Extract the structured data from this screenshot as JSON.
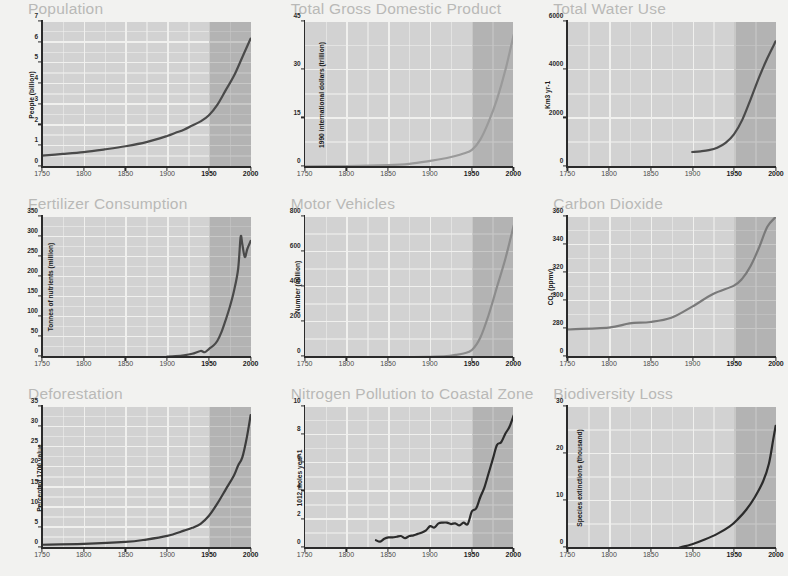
{
  "figure": {
    "background": "#f2f2f0",
    "plot_bg": "#d2d2d2",
    "gridline_color": "#f0f0ee",
    "shade_color": "rgba(110,110,110,.30)",
    "shade_start_year": 1950,
    "title_color": "#b9b9b7"
  },
  "xaxis": {
    "ticks": [
      "1750",
      "1800",
      "1850",
      "1900",
      "1950",
      "2000"
    ],
    "highlight_ticks": [
      "1950",
      "2000"
    ],
    "min": 1750,
    "max": 2000
  },
  "chart_data": [
    {
      "type": "line",
      "title": "Population",
      "ylabel": "People (billion)",
      "xlabel": "",
      "yticks": [
        0,
        1,
        2,
        3,
        4,
        5,
        6,
        7
      ],
      "ylim": [
        0,
        7
      ],
      "xlim": [
        1750,
        2000
      ],
      "line_color": "#4a4a4a",
      "x": [
        1750,
        1775,
        1800,
        1825,
        1850,
        1875,
        1900,
        1910,
        1920,
        1930,
        1940,
        1950,
        1960,
        1970,
        1980,
        1990,
        2000
      ],
      "values": [
        0.55,
        0.63,
        0.72,
        0.85,
        1.0,
        1.2,
        1.5,
        1.65,
        1.8,
        2.0,
        2.2,
        2.5,
        3.0,
        3.7,
        4.4,
        5.3,
        6.2
      ]
    },
    {
      "type": "line",
      "title": "Total Gross Domestic Product",
      "ylabel": "1990 international dollars (trillion)",
      "xlabel": "",
      "yticks": [
        0,
        15,
        30,
        45
      ],
      "ylim": [
        0,
        45
      ],
      "xlim": [
        1750,
        2000
      ],
      "line_color": "#9a9a9a",
      "x": [
        1750,
        1800,
        1850,
        1875,
        1900,
        1920,
        1930,
        1940,
        1950,
        1960,
        1970,
        1980,
        1990,
        2000
      ],
      "values": [
        0.2,
        0.3,
        0.6,
        1.0,
        1.9,
        2.8,
        3.4,
        4.2,
        5.3,
        8.5,
        14.0,
        21.0,
        30.0,
        41.0
      ]
    },
    {
      "type": "line",
      "title": "Total Water Use",
      "ylabel": "Km3 yr-1",
      "xlabel": "",
      "yticks": [
        0,
        2000,
        4000,
        6000
      ],
      "ylim": [
        0,
        6000
      ],
      "xlim": [
        1750,
        2000
      ],
      "line_color": "#4a4a4a",
      "x": [
        1900,
        1910,
        1920,
        1930,
        1940,
        1950,
        1960,
        1970,
        1980,
        1990,
        2000
      ],
      "values": [
        620,
        650,
        700,
        800,
        1000,
        1350,
        1950,
        2800,
        3700,
        4500,
        5200
      ]
    },
    {
      "type": "line",
      "title": "Fertilizer Consumption",
      "ylabel": "Tonnes of nutrients (million)",
      "xlabel": "",
      "yticks": [
        0,
        50,
        100,
        150,
        200,
        250,
        300,
        350
      ],
      "ylim": [
        0,
        350
      ],
      "xlim": [
        1750,
        2000
      ],
      "line_color": "#4a4a4a",
      "x": [
        1900,
        1910,
        1920,
        1930,
        1940,
        1945,
        1950,
        1955,
        1960,
        1965,
        1970,
        1975,
        1980,
        1985,
        1988,
        1990,
        1993,
        1996,
        2000
      ],
      "values": [
        1,
        2,
        4,
        8,
        15,
        12,
        20,
        28,
        40,
        62,
        92,
        125,
        165,
        220,
        300,
        282,
        250,
        270,
        290
      ]
    },
    {
      "type": "line",
      "title": "Motor Vehicles",
      "ylabel": "Number (million)",
      "xlabel": "",
      "yticks": [
        0,
        200,
        400,
        600,
        800
      ],
      "ylim": [
        0,
        800
      ],
      "xlim": [
        1750,
        2000
      ],
      "line_color": "#8c8c8c",
      "x": [
        1750,
        1880,
        1900,
        1920,
        1930,
        1940,
        1950,
        1960,
        1970,
        1980,
        1990,
        2000
      ],
      "values": [
        0,
        0,
        1,
        5,
        12,
        20,
        40,
        110,
        240,
        400,
        560,
        750
      ]
    },
    {
      "type": "line",
      "title": "Carbon Dioxide",
      "ylabel": "CO2 (ppmv)",
      "xlabel": "",
      "yticks": [
        0,
        280,
        300,
        320,
        340,
        360
      ],
      "ylim": [
        0,
        360
      ],
      "axis_break": true,
      "xlim": [
        1750,
        2000
      ],
      "line_color": "#7a7a7a",
      "x": [
        1750,
        1800,
        1825,
        1850,
        1875,
        1900,
        1925,
        1950,
        1960,
        1970,
        1980,
        1990,
        2000
      ],
      "values": [
        277,
        281,
        284,
        285,
        288,
        296,
        305,
        311,
        316,
        325,
        338,
        353,
        369
      ]
    },
    {
      "type": "line",
      "title": "Deforestation",
      "ylabel": "Percent of 1700 value",
      "xlabel": "",
      "yticks": [
        0,
        5,
        10,
        15,
        20,
        25,
        30,
        35
      ],
      "ylim": [
        0,
        35
      ],
      "xlim": [
        1750,
        2000
      ],
      "line_color": "#3c3c3c",
      "x": [
        1750,
        1800,
        1850,
        1875,
        1900,
        1920,
        1930,
        1940,
        1950,
        1960,
        1970,
        1980,
        1985,
        1990,
        1995,
        2000
      ],
      "values": [
        0.8,
        1.0,
        1.5,
        2.1,
        3.0,
        4.3,
        5.0,
        6.0,
        8.0,
        11.0,
        14.5,
        18.0,
        20.5,
        22.5,
        27.0,
        33.0
      ]
    },
    {
      "type": "line",
      "title": "Nitrogen Pollution to Coastal Zone",
      "ylabel": "1012 moles year-1",
      "xlabel": "",
      "yticks": [
        0,
        2,
        4,
        6,
        8,
        10
      ],
      "ylim": [
        0,
        10
      ],
      "xlim": [
        1750,
        2000
      ],
      "line_color": "#2b2b2b",
      "x": [
        1835,
        1840,
        1845,
        1850,
        1855,
        1860,
        1865,
        1870,
        1875,
        1880,
        1885,
        1890,
        1895,
        1900,
        1905,
        1910,
        1915,
        1920,
        1925,
        1930,
        1935,
        1940,
        1945,
        1950,
        1955,
        1960,
        1965,
        1970,
        1975,
        1980,
        1985,
        1990,
        1995,
        2000
      ],
      "values": [
        0.55,
        0.45,
        0.65,
        0.75,
        0.75,
        0.8,
        0.85,
        0.7,
        0.85,
        0.9,
        1.0,
        1.1,
        1.25,
        1.55,
        1.45,
        1.75,
        1.8,
        1.8,
        1.7,
        1.75,
        1.6,
        1.8,
        1.7,
        2.6,
        2.8,
        3.6,
        4.3,
        5.3,
        6.3,
        7.3,
        7.5,
        8.1,
        8.6,
        9.4
      ]
    },
    {
      "type": "line",
      "title": "Biodiversity Loss",
      "ylabel": "Species extinctions (thousand)",
      "xlabel": "",
      "yticks": [
        0,
        10,
        20,
        30
      ],
      "ylim": [
        0,
        30
      ],
      "xlim": [
        1750,
        2000
      ],
      "line_color": "#2b2b2b",
      "x": [
        1885,
        1900,
        1915,
        1930,
        1945,
        1955,
        1965,
        1975,
        1985,
        1992,
        1997,
        2000
      ],
      "values": [
        0.1,
        0.8,
        1.8,
        3.0,
        4.6,
        6.2,
        8.2,
        10.8,
        14.2,
        18.0,
        23.0,
        26.0
      ]
    }
  ]
}
